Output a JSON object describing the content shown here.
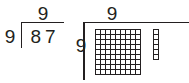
{
  "figure": {
    "kind": "division-area-model",
    "ink_color": "#231f20",
    "background_color": "#ffffff"
  },
  "long_division": {
    "quotient": "9",
    "divisor": "9",
    "dividend": "87",
    "bracket_icon": "division-bracket-icon"
  },
  "area_model": {
    "top_label": "9",
    "side_label": "9",
    "bracket_icon": "area-bracket-icon",
    "grid": {
      "rows": 9,
      "columns": 9,
      "total_units": 81
    },
    "remainder_strip": {
      "rows": 6,
      "columns": 1,
      "total_units": 6
    }
  },
  "chart_data": {
    "type": "table",
    "categories": [
      "full 9 by 9 block",
      "remainder strip"
    ],
    "values": [
      81,
      6
    ],
    "xlabel": "",
    "ylabel": "unit squares"
  }
}
